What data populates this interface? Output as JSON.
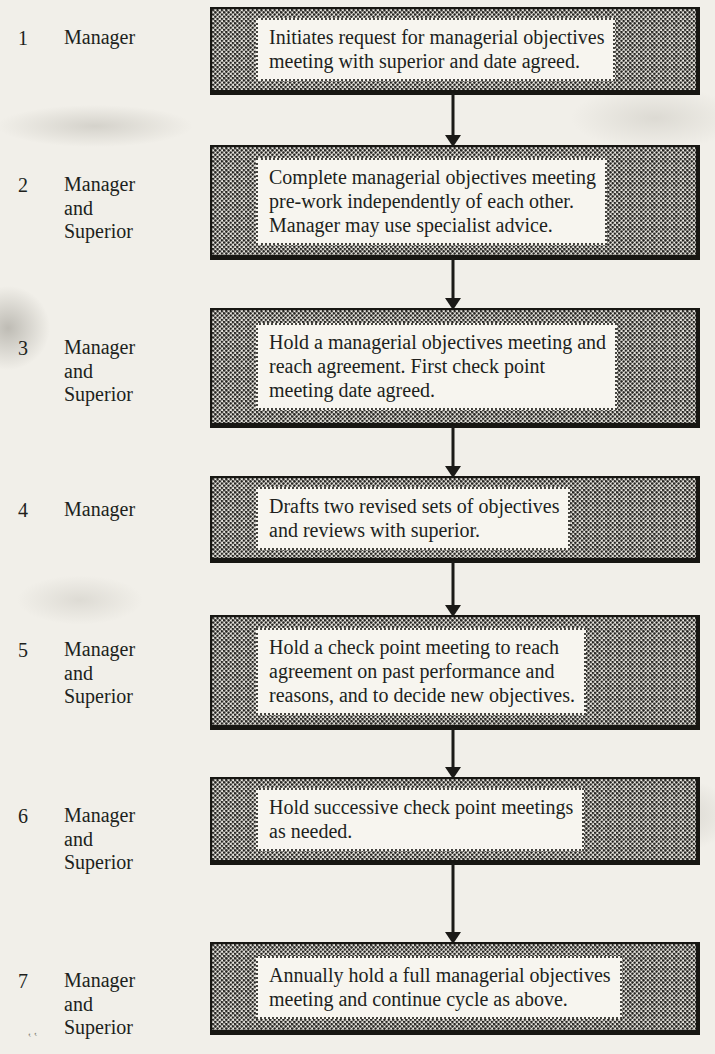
{
  "flow": {
    "steps": [
      {
        "number": "1",
        "role": "Manager",
        "text": "Initiates request for managerial objectives\nmeeting with superior and date agreed."
      },
      {
        "number": "2",
        "role": "Manager\nand\nSuperior",
        "text": "Complete managerial objectives meeting\npre-work independently of each other.\nManager may use specialist advice."
      },
      {
        "number": "3",
        "role": "Manager\nand\nSuperior",
        "text": "Hold a managerial objectives meeting and\nreach agreement. First check point\nmeeting date agreed."
      },
      {
        "number": "4",
        "role": "Manager",
        "text": "Drafts two revised sets of objectives\nand reviews with superior."
      },
      {
        "number": "5",
        "role": "Manager\nand\nSuperior",
        "text": "Hold a check point meeting to reach\nagreement on past performance and\nreasons, and to decide new objectives."
      },
      {
        "number": "6",
        "role": "Manager\nand\nSuperior",
        "text": "Hold successive check point meetings\nas needed."
      },
      {
        "number": "7",
        "role": "Manager\nand\nSuperior",
        "text": "Annually hold a full managerial objectives\nmeeting and continue cycle as above."
      }
    ],
    "artifact": "‛‛",
    "colors": {
      "page_bg": "#f1efe9",
      "ink": "#201f1c",
      "box_stipple_bg": "#ebe9e2",
      "box_dot": "#23221f",
      "inner_fill": "#f7f5ef"
    }
  }
}
